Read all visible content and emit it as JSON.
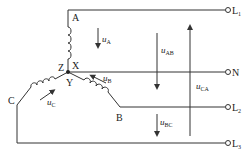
{
  "diagram": {
    "nodes": {
      "A": "A",
      "X": "X",
      "Y": "Y",
      "Z": "Z",
      "B": "B",
      "C": "C"
    },
    "terminals": [
      {
        "id": "L1",
        "main": "L",
        "sub": "1"
      },
      {
        "id": "N",
        "main": "N",
        "sub": ""
      },
      {
        "id": "L2",
        "main": "L",
        "sub": "2"
      },
      {
        "id": "L3",
        "main": "L",
        "sub": "3"
      }
    ],
    "voltages": {
      "uA": {
        "main": "u",
        "sub": "A"
      },
      "uB": {
        "main": "u",
        "sub": "B"
      },
      "uC": {
        "main": "u",
        "sub": "C"
      },
      "uAB": {
        "main": "u",
        "sub": "AB"
      },
      "uBC": {
        "main": "u",
        "sub": "BC"
      },
      "uCA": {
        "main": "u",
        "sub": "CA"
      }
    },
    "colors": {
      "line": "#333333",
      "background": "#ffffff"
    }
  }
}
